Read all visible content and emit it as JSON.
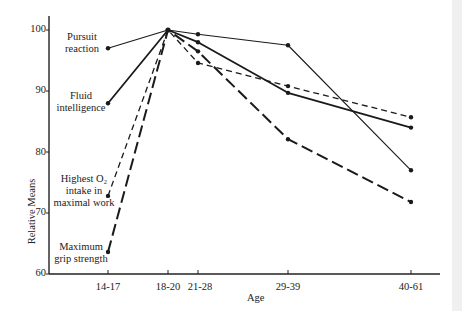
{
  "chart_data": {
    "type": "line",
    "title": "",
    "xlabel": "Age",
    "ylabel": "Relative Means",
    "categories": [
      "14-17",
      "18-20",
      "21-28",
      "29-39",
      "40-61"
    ],
    "x_positions": [
      108,
      168,
      198,
      288,
      411
    ],
    "ylim": [
      60,
      100
    ],
    "yticks": [
      "60",
      "70",
      "80",
      "90",
      "100"
    ],
    "grid": false,
    "legend_position": "inline labels at left",
    "series": [
      {
        "name": "Pursuit reaction",
        "style": "solid-thin",
        "values": [
          97,
          100,
          99.3,
          97.5,
          77
        ]
      },
      {
        "name": "Fluid intelligence",
        "style": "solid-thick",
        "values": [
          88,
          100,
          98,
          89.7,
          84
        ]
      },
      {
        "name": "Highest O2 intake in maximal work",
        "style": "short-dash",
        "values": [
          72.8,
          100,
          94.6,
          90.8,
          85.7
        ]
      },
      {
        "name": "Maximum grip strength",
        "style": "long-dash",
        "values": [
          63.6,
          100,
          96.5,
          82.1,
          71.8
        ]
      }
    ]
  },
  "labels": {
    "pursuit": [
      "Pursuit",
      "reaction"
    ],
    "fluid": [
      "Fluid",
      "intelligence"
    ],
    "o2": [
      "Highest O₂",
      "intake in",
      "maximal work"
    ],
    "grip": [
      "Maximum",
      "grip strength"
    ]
  }
}
